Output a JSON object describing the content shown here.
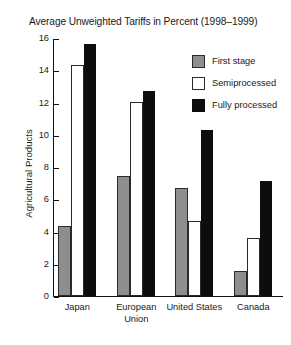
{
  "chart_data": {
    "type": "bar",
    "title": "Average Unweighted Tariffs in Percent (1998–1999)",
    "xlabel": "",
    "ylabel": "Agricultural Products",
    "ylim": [
      0,
      16
    ],
    "yticks": [
      0,
      2,
      4,
      6,
      8,
      10,
      12,
      14,
      16
    ],
    "ytick_labels": [
      "0",
      "2",
      "4",
      "6",
      "8",
      "10",
      "12",
      "14",
      "16"
    ],
    "grid": false,
    "legend_position": "upper right",
    "categories": [
      "Japan",
      "European Union",
      "United States",
      "Canada"
    ],
    "category_label_lines": [
      [
        "Japan"
      ],
      [
        "European",
        "Union"
      ],
      [
        "United States"
      ],
      [
        "Canada"
      ]
    ],
    "series": [
      {
        "name": "First stage",
        "color": "#8e8e8e",
        "values": [
          4.3,
          7.4,
          6.7,
          1.5
        ]
      },
      {
        "name": "Semiprocessed",
        "color": "#ffffff",
        "values": [
          14.3,
          12.0,
          4.6,
          3.6
        ]
      },
      {
        "name": "Fully processed",
        "color": "#0d0d0d",
        "values": [
          15.6,
          12.7,
          10.3,
          7.1
        ]
      }
    ]
  },
  "legend": {
    "items": [
      {
        "label": "First stage",
        "swatch": "first"
      },
      {
        "label": "Semiprocessed",
        "swatch": "semi"
      },
      {
        "label": "Fully processed",
        "swatch": "fully"
      }
    ]
  }
}
